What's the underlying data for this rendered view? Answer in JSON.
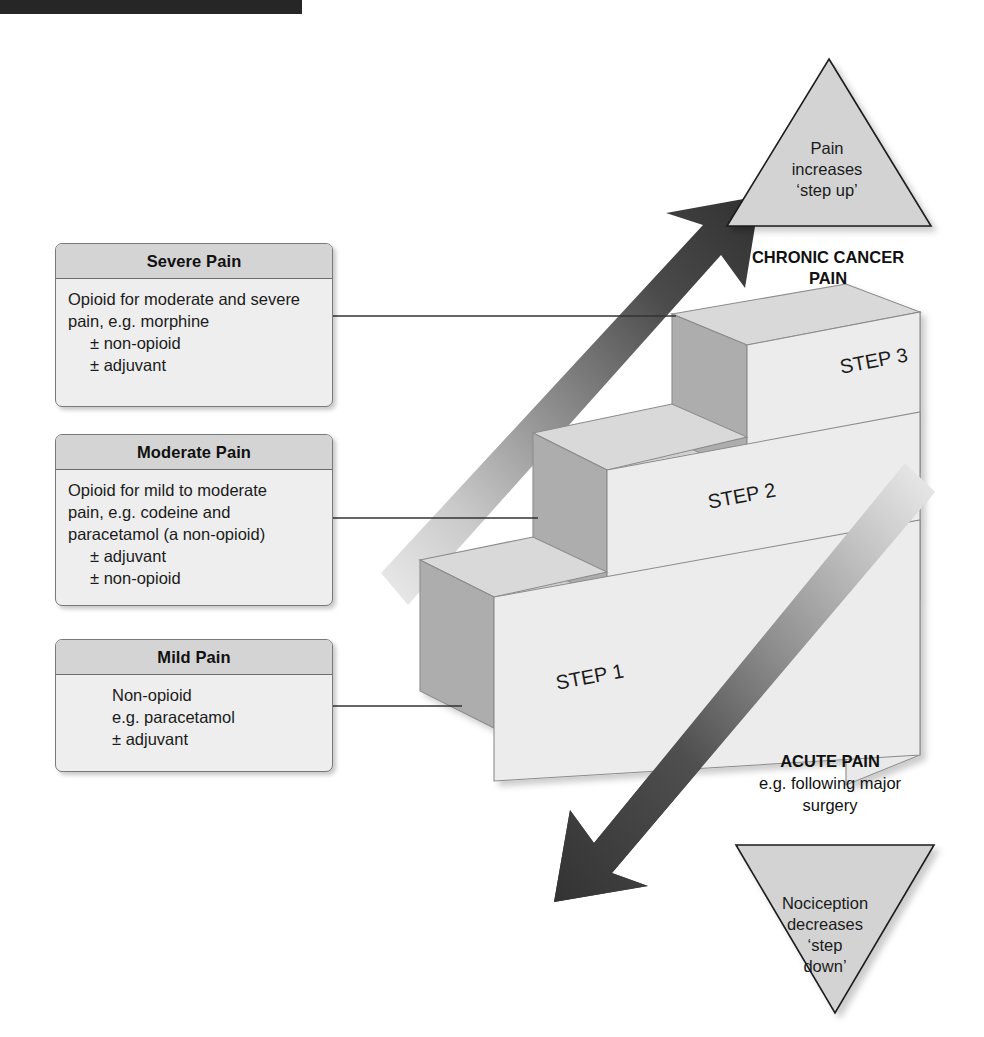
{
  "page": {
    "background": "#ffffff",
    "top_bar_color": "#262626"
  },
  "boxes": [
    {
      "id": "severe",
      "header": "Severe Pain",
      "lines": [
        {
          "text": "Opioid for moderate and severe",
          "indent": 0
        },
        {
          "text": "pain, e.g. morphine",
          "indent": 0
        },
        {
          "text": "± non-opioid",
          "indent": 1
        },
        {
          "text": "± adjuvant",
          "indent": 1
        }
      ]
    },
    {
      "id": "moderate",
      "header": "Moderate Pain",
      "lines": [
        {
          "text": "Opioid for mild to moderate",
          "indent": 0
        },
        {
          "text": "pain, e.g. codeine and",
          "indent": 0
        },
        {
          "text": "paracetamol (a non-opioid)",
          "indent": 0
        },
        {
          "text": "± adjuvant",
          "indent": 1
        },
        {
          "text": "± non-opioid",
          "indent": 1
        }
      ]
    },
    {
      "id": "mild",
      "header": "Mild Pain",
      "lines": [
        {
          "text": "Non-opioid",
          "indent": 2
        },
        {
          "text": "e.g. paracetamol",
          "indent": 2
        },
        {
          "text": "± adjuvant",
          "indent": 2
        }
      ]
    }
  ],
  "steps": {
    "step1_label": "STEP 1",
    "step2_label": "STEP 2",
    "step3_label": "STEP 3",
    "top_face_color": "#d8d8d8",
    "riser_face_color": "#adadad",
    "front_face_color": "#ececec",
    "side_face_color": "#e4e4e4",
    "outline_color": "#7c7c7c"
  },
  "triangles": {
    "up": {
      "name": "pain-increases-triangle",
      "lines": [
        "Pain",
        "increases",
        "‘step up’"
      ],
      "fill": "#d3d3d3",
      "stroke": "#1b1b1b"
    },
    "down": {
      "name": "nociception-decreases-triangle",
      "lines": [
        "Nociception",
        "decreases",
        "‘step",
        "down’"
      ],
      "fill": "#d3d3d3",
      "stroke": "#1b1b1b"
    }
  },
  "captions": {
    "chronic": "CHRONIC CANCER PAIN",
    "chronic_line1": "CHRONIC CANCER",
    "chronic_line2": "PAIN",
    "acute_bold": "ACUTE PAIN",
    "acute_line1": "e.g. following major",
    "acute_line2": "surgery"
  },
  "arrows": {
    "up": {
      "name": "step-up-arrow",
      "direction": "up-right",
      "color_dark": "#3a3a3a",
      "color_light": "#e2e2e2"
    },
    "down": {
      "name": "step-down-arrow",
      "direction": "down-left",
      "color_dark": "#3a3a3a",
      "color_light": "#e6e6e6"
    }
  },
  "connectors": [
    {
      "name": "connector-severe",
      "from_box": "severe",
      "to_step": "step3"
    },
    {
      "name": "connector-moderate",
      "from_box": "moderate",
      "to_step": "step2"
    },
    {
      "name": "connector-mild",
      "from_box": "mild",
      "to_step": "step1"
    }
  ]
}
